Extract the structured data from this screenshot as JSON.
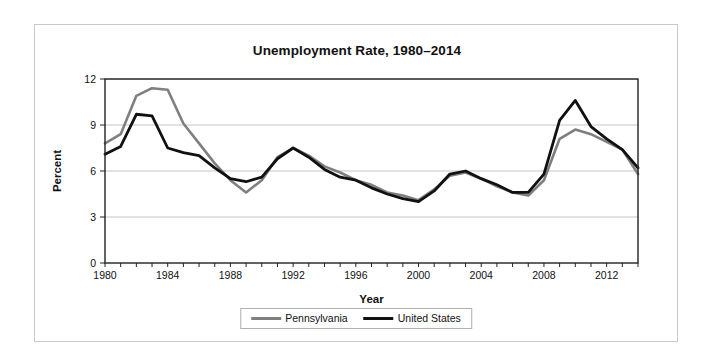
{
  "chart_data": {
    "type": "line",
    "title": "Unemployment Rate, 1980–2014",
    "xlabel": "Year",
    "ylabel": "Percent",
    "x": [
      1980,
      1981,
      1982,
      1983,
      1984,
      1985,
      1986,
      1987,
      1988,
      1989,
      1990,
      1991,
      1992,
      1993,
      1994,
      1995,
      1996,
      1997,
      1998,
      1999,
      2000,
      2001,
      2002,
      2003,
      2004,
      2005,
      2006,
      2007,
      2008,
      2009,
      2010,
      2011,
      2012,
      2013,
      2014
    ],
    "xlim": [
      1980,
      2014
    ],
    "ylim": [
      0,
      12
    ],
    "yticks": [
      0,
      3,
      6,
      9,
      12
    ],
    "xticks_labeled": [
      1980,
      1984,
      1988,
      1992,
      1996,
      2000,
      2004,
      2008,
      2012
    ],
    "grid": "horizontal",
    "legend_position": "bottom",
    "series": [
      {
        "name": "Pennsylvania",
        "color": "#7f7f7f",
        "values": [
          7.8,
          8.4,
          10.9,
          11.4,
          11.3,
          9.1,
          7.8,
          6.5,
          5.4,
          4.6,
          5.4,
          6.9,
          7.5,
          7.0,
          6.3,
          5.9,
          5.4,
          5.1,
          4.6,
          4.4,
          4.1,
          4.8,
          5.7,
          5.9,
          5.5,
          5.0,
          4.6,
          4.4,
          5.4,
          8.1,
          8.7,
          8.4,
          7.9,
          7.4,
          5.8
        ]
      },
      {
        "name": "United States",
        "color": "#111111",
        "values": [
          7.1,
          7.6,
          9.7,
          9.6,
          7.5,
          7.2,
          7.0,
          6.2,
          5.5,
          5.3,
          5.6,
          6.8,
          7.5,
          6.9,
          6.1,
          5.6,
          5.4,
          4.9,
          4.5,
          4.2,
          4.0,
          4.7,
          5.8,
          6.0,
          5.5,
          5.1,
          4.6,
          4.6,
          5.8,
          9.3,
          10.6,
          8.9,
          8.1,
          7.4,
          6.2
        ]
      }
    ]
  },
  "legend": {
    "items": [
      {
        "label": "Pennsylvania"
      },
      {
        "label": "United States"
      }
    ]
  }
}
